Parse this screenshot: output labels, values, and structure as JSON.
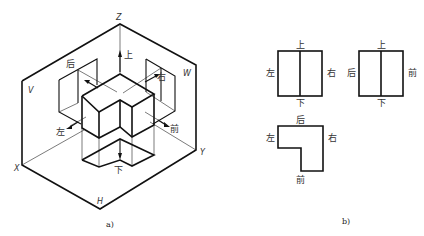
{
  "figure_a": {
    "caption": "a)",
    "axes": {
      "z": "Z",
      "x": "X",
      "y": "Y"
    },
    "planes": {
      "v": "V",
      "w": "W",
      "h": "H"
    },
    "directions": {
      "top": "上",
      "bottom": "下",
      "left": "左",
      "right": "右",
      "back": "后",
      "front": "前"
    }
  },
  "figure_b": {
    "caption": "b)",
    "views": [
      {
        "name": "front-view",
        "top": "上",
        "bottom": "下",
        "left": "左",
        "right": "右"
      },
      {
        "name": "side-view",
        "top": "上",
        "bottom": "下",
        "left": "后",
        "right": "前"
      },
      {
        "name": "top-view",
        "top": "后",
        "bottom": "前",
        "left": "左",
        "right": "右"
      }
    ]
  },
  "colors": {
    "line": "#111111",
    "background": "#ffffff"
  }
}
